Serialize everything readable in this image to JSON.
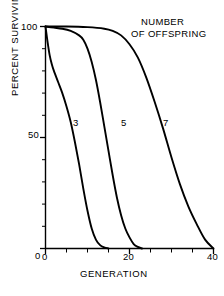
{
  "chart_data": {
    "type": "line",
    "title": "",
    "legend_title_lines": [
      "NUMBER",
      "OF OFFSPRING"
    ],
    "legend_position": "top-right",
    "xlabel": "GENERATION",
    "ylabel": "PERCENT SURVIVING",
    "xlim": [
      0,
      40
    ],
    "ylim": [
      0,
      100
    ],
    "xticks": [
      0,
      20,
      40
    ],
    "xticks_minor": [
      5,
      10,
      15,
      25,
      30,
      35
    ],
    "yticks": [
      0,
      50,
      100
    ],
    "yticks_minor": [
      10,
      20,
      30,
      40,
      60,
      70,
      80,
      90
    ],
    "xtick_labels": [
      "0",
      "20",
      "40"
    ],
    "ytick_labels": [
      "0",
      "50",
      "100"
    ],
    "grid": false,
    "line_color": "#000000",
    "background": "#ffffff",
    "series": [
      {
        "name": "3",
        "label": "3",
        "x": [
          0,
          0.5,
          1,
          1.5,
          2,
          3,
          4,
          5,
          6,
          7,
          8,
          9,
          10,
          11,
          12,
          13,
          14,
          15
        ],
        "values": [
          100,
          93,
          87,
          83,
          80,
          75,
          70,
          64,
          57,
          48,
          38,
          27,
          17,
          9,
          4,
          1.5,
          0.5,
          0
        ]
      },
      {
        "name": "5",
        "label": "5",
        "x": [
          0,
          2,
          4,
          6,
          8,
          9,
          10,
          11,
          12,
          13,
          14,
          15,
          16,
          17,
          18,
          19,
          20,
          21,
          22,
          23
        ],
        "values": [
          100,
          99.5,
          99,
          98,
          96,
          94,
          90,
          84,
          76,
          66,
          55,
          44,
          33,
          23,
          15,
          9,
          5,
          2,
          0.7,
          0
        ]
      },
      {
        "name": "7",
        "label": "7",
        "x": [
          0,
          5,
          10,
          14,
          16,
          18,
          20,
          22,
          24,
          26,
          28,
          30,
          32,
          34,
          36,
          38,
          40
        ],
        "values": [
          100,
          100,
          99.7,
          99,
          98,
          96,
          92,
          86,
          77,
          66,
          54,
          41,
          29,
          19,
          11,
          4,
          0
        ]
      }
    ]
  },
  "axis": {
    "ylabel": "PERCENT SURVIVING",
    "xlabel": "GENERATION",
    "ytick_100": "100",
    "ytick_50": "50",
    "ytick_0": "0",
    "xtick_0": "0",
    "xtick_20": "20",
    "xtick_40": "40"
  },
  "legend": {
    "line1": "NUMBER",
    "line2": "OF OFFSPRING"
  },
  "series_labels": {
    "s0": "3",
    "s1": "5",
    "s2": "7"
  }
}
